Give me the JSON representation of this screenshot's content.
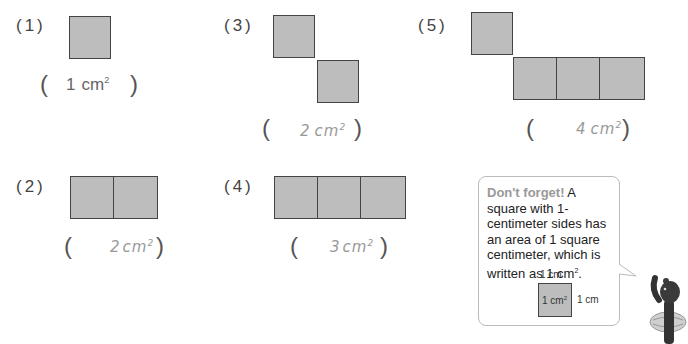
{
  "problems": [
    {
      "id": "1",
      "label": "(1)",
      "squares": 1,
      "answer_number": "1",
      "answer_unit": "cm",
      "answer_exp": "2",
      "answer_style": "typed"
    },
    {
      "id": "2",
      "label": "(2)",
      "squares": 2,
      "answer_number": "2",
      "answer_unit": "cm",
      "answer_exp": "2",
      "answer_style": "handwritten"
    },
    {
      "id": "3",
      "label": "(3)",
      "squares": 2,
      "answer_number": "2",
      "answer_unit": "cm",
      "answer_exp": "2",
      "answer_style": "handwritten"
    },
    {
      "id": "4",
      "label": "(4)",
      "squares": 3,
      "answer_number": "3",
      "answer_unit": "cm",
      "answer_exp": "2",
      "answer_style": "handwritten"
    },
    {
      "id": "5",
      "label": "(5)",
      "squares": 4,
      "answer_number": "4",
      "answer_unit": "cm",
      "answer_exp": "2",
      "answer_style": "handwritten"
    }
  ],
  "parens": {
    "open": "(",
    "close": ")"
  },
  "tip": {
    "heading": "Don't forget!",
    "body_before": " A square with 1-centimeter sides has an area of 1 square centimeter, which is written as 1 cm",
    "body_exp": "2",
    "body_after": ".",
    "diagram": {
      "top_label": "1 cm",
      "side_label": "1 cm",
      "center_label": "1 cm",
      "center_exp": "2"
    }
  },
  "colors": {
    "square_fill": "#bdbdbd",
    "square_border": "#444444",
    "heading": "#999999",
    "handwriting": "#999999"
  }
}
